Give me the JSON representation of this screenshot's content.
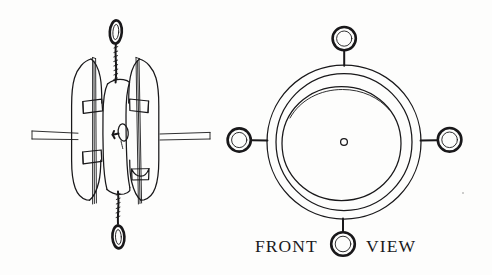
{
  "document": {
    "kind": "technical-line-drawing",
    "background_color": "#fdfdfc",
    "ink_color": "#19181a"
  },
  "caption": {
    "front_label": "FRONT",
    "view_label": "VIEW",
    "full_text": "FRONT VIEW"
  },
  "figures": [
    {
      "id": "side-view",
      "name": "side-view-figure",
      "description": "Side elevation of a spool-shaped body with two outer blade plates, two vertical rods, four clamp blocks, a central eyelet, a twisted line exiting top and bottom with terminal loops, and a pair of parallel horizontal wires passing through"
    },
    {
      "id": "front-view",
      "name": "front-view-figure",
      "description": "Front elevation showing concentric circular rims with a small central hole and four radial ring attachments at top, bottom, left and right"
    }
  ],
  "front_view_rings": [
    {
      "position": "top",
      "label": "ring-top"
    },
    {
      "position": "right",
      "label": "ring-right"
    },
    {
      "position": "bottom",
      "label": "ring-bottom"
    },
    {
      "position": "left",
      "label": "ring-left"
    }
  ]
}
